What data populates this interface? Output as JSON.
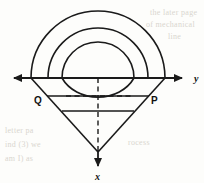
{
  "figure": {
    "background_color": "#fdfdfb",
    "stroke_color": "#1a1a1a",
    "axes": {
      "horizontal": {
        "name": "y-axis",
        "label": "y",
        "label_x": 195,
        "label_y": 82,
        "y": 78,
        "x_start": 5,
        "x_end": 188,
        "style": "solid",
        "arrow_left": true,
        "arrow_right": true
      },
      "vertical": {
        "name": "x-axis",
        "label": "x",
        "label_x": 98,
        "label_y": 179,
        "x": 98,
        "y_start": 78,
        "y_end": 156,
        "style": "dashed",
        "arrow_down": true
      },
      "origin": {
        "x": 98,
        "y": 78
      }
    },
    "arcs": [
      {
        "name": "outer-semicircle",
        "center_x": 98,
        "center_y": 78,
        "radius": 67,
        "left_x": 31,
        "right_x": 165,
        "top_y": 11
      },
      {
        "name": "middle-semicircle",
        "center_x": 98,
        "center_y": 78,
        "radius": 50,
        "left_x": 48,
        "right_x": 148,
        "top_y": 28
      },
      {
        "name": "inner-semicircle",
        "center_x": 98,
        "center_y": 78,
        "radius": 36,
        "left_x": 62,
        "right_x": 134,
        "top_y": 42
      }
    ],
    "chords": [
      {
        "name": "upper-chord-dashed",
        "y": 78,
        "x1": 31,
        "x2": 165,
        "style": "dashed"
      },
      {
        "name": "mid-chord-solid",
        "y": 96,
        "x1": 48,
        "x2": 148,
        "style": "solid"
      },
      {
        "name": "mid-chord-dashed",
        "y": 96,
        "x1": 62,
        "x2": 134,
        "style": "dashed"
      },
      {
        "name": "lower-chord-solid",
        "y": 111,
        "x1": 62,
        "x2": 134,
        "style": "solid"
      }
    ],
    "v_lines": [
      {
        "name": "left-v-edge",
        "x1": 31,
        "y1": 78,
        "x2": 98,
        "y2": 152
      },
      {
        "name": "right-v-edge",
        "x1": 165,
        "y1": 78,
        "x2": 98,
        "y2": 152
      }
    ],
    "points": [
      {
        "name": "point-Q",
        "label": "Q",
        "label_x": 37,
        "label_y": 103,
        "marker_x": 48,
        "marker_y": 96
      },
      {
        "name": "point-P",
        "label": "P",
        "label_x": 152,
        "label_y": 103,
        "marker_x": 148,
        "marker_y": 96
      }
    ],
    "ghost_text": [
      {
        "name": "ghost-line-1",
        "text": "the later   page",
        "x": 150,
        "y": 8
      },
      {
        "name": "ghost-line-2",
        "text": "of mechanical",
        "x": 148,
        "y": 20
      },
      {
        "name": "ghost-line-3",
        "text": "line",
        "x": 168,
        "y": 32
      },
      {
        "name": "ghost-line-4",
        "text": "letter  pa",
        "x": 6,
        "y": 128
      },
      {
        "name": "ghost-line-5",
        "text": "ind  (3)  we",
        "x": 6,
        "y": 142
      },
      {
        "name": "ghost-line-6",
        "text": "am I) as",
        "x": 6,
        "y": 156
      },
      {
        "name": "ghost-line-7",
        "text": "rocess",
        "x": 130,
        "y": 140
      }
    ]
  }
}
